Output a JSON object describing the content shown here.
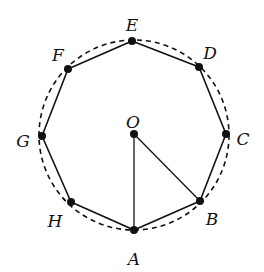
{
  "diagram": {
    "type": "regular-octagon-inscribed-in-circle",
    "colors": {
      "stroke": "#111111",
      "background": "#ffffff"
    },
    "circle": {
      "cx": 134,
      "cy": 135,
      "r": 95,
      "style": "dashed"
    },
    "center": {
      "name": "O",
      "x": 134,
      "y": 134,
      "label_x": 133,
      "label_y": 123
    },
    "vertices": [
      {
        "name": "A",
        "x": 134,
        "y": 230,
        "label_x": 134,
        "label_y": 260
      },
      {
        "name": "B",
        "x": 200,
        "y": 201,
        "label_x": 212,
        "label_y": 220
      },
      {
        "name": "C",
        "x": 226,
        "y": 134,
        "label_x": 243,
        "label_y": 140
      },
      {
        "name": "D",
        "x": 199,
        "y": 67,
        "label_x": 210,
        "label_y": 54
      },
      {
        "name": "E",
        "x": 132,
        "y": 41,
        "label_x": 132,
        "label_y": 26
      },
      {
        "name": "F",
        "x": 68,
        "y": 69,
        "label_x": 58,
        "label_y": 56
      },
      {
        "name": "G",
        "x": 42,
        "y": 136,
        "label_x": 23,
        "label_y": 142
      },
      {
        "name": "H",
        "x": 71,
        "y": 202,
        "label_x": 55,
        "label_y": 222
      }
    ],
    "segments": [
      {
        "from": "O",
        "to": "A"
      },
      {
        "from": "O",
        "to": "B"
      }
    ]
  }
}
